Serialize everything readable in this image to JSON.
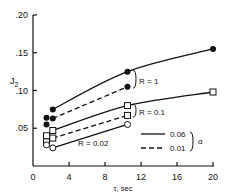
{
  "chart_data": {
    "type": "line",
    "title": "",
    "xlabel": "τ, sec",
    "ylabel": "J2",
    "xlim": [
      0,
      20
    ],
    "ylim": [
      0,
      0.2
    ],
    "x_ticks": [
      "0",
      "4",
      "8",
      "12",
      "16",
      "20"
    ],
    "y_ticks": [
      ".05",
      ".10",
      ".15",
      ".20"
    ],
    "grid": false,
    "legend": {
      "position": "lower right",
      "entries": [
        {
          "label": "0.06",
          "style": "solid"
        },
        {
          "label": "0.01",
          "style": "dashed"
        }
      ],
      "group_label": "α"
    },
    "annotations": [
      "R = 1",
      "R = 0.1",
      "R = 0.02"
    ],
    "series": [
      {
        "name": "R = 1, α = 0.06",
        "style": "solid",
        "marker": "filled-circle",
        "x": [
          1.5,
          2.2,
          10.5,
          20
        ],
        "y": [
          0.064,
          0.075,
          0.125,
          0.155
        ]
      },
      {
        "name": "R = 1, α = 0.01",
        "style": "dashed",
        "marker": "filled-circle",
        "x": [
          1.5,
          2.2,
          10.5
        ],
        "y": [
          0.055,
          0.063,
          0.105
        ]
      },
      {
        "name": "R = 0.1, α = 0.06",
        "style": "solid",
        "marker": "open-square",
        "x": [
          1.5,
          2.2,
          10.5,
          20
        ],
        "y": [
          0.04,
          0.047,
          0.08,
          0.098
        ]
      },
      {
        "name": "R = 0.1, α = 0.01",
        "style": "dashed",
        "marker": "open-square",
        "x": [
          1.5,
          2.2,
          10.5
        ],
        "y": [
          0.032,
          0.037,
          0.067
        ]
      },
      {
        "name": "R = 0.02, α = 0.06",
        "style": "solid",
        "marker": "open-circle",
        "x": [
          1.5,
          2.2,
          10.5
        ],
        "y": [
          0.028,
          0.024,
          0.055
        ]
      }
    ]
  }
}
